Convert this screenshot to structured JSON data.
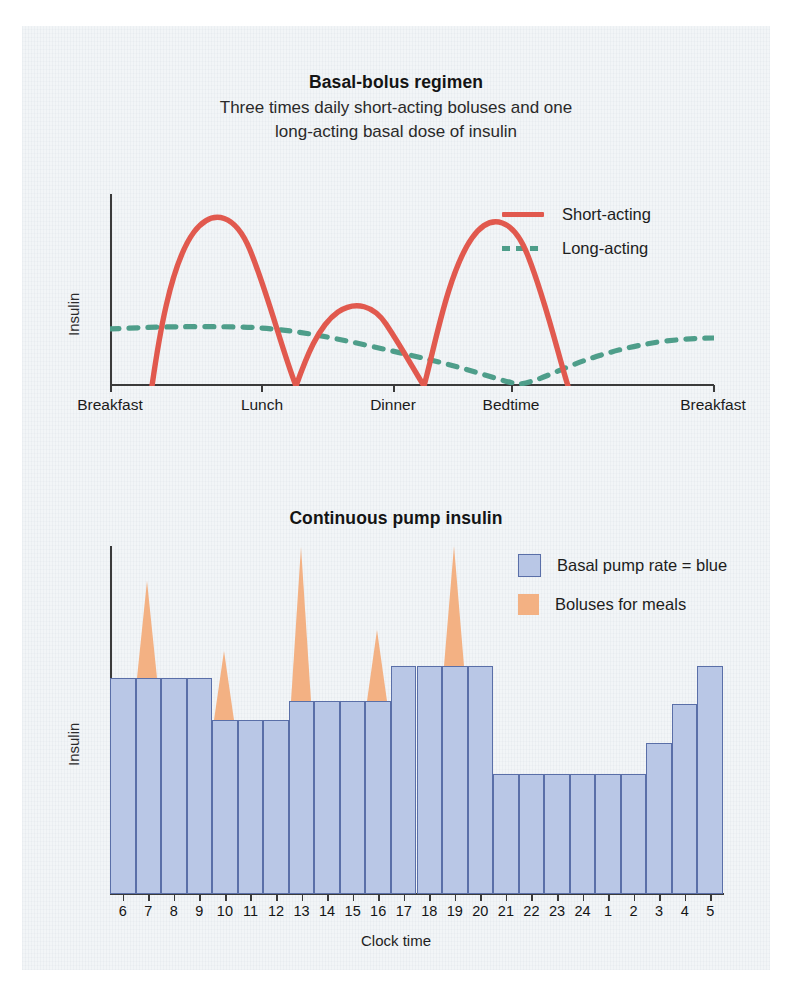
{
  "page": {
    "background": "#f2f5f7"
  },
  "colors": {
    "short_acting": "#e1594e",
    "long_acting": "#4e9e8a",
    "basal_fill": "#b9c7e6",
    "basal_stroke": "#5a6fa8",
    "bolus_fill": "#f3b183",
    "axis": "#3a3a3a",
    "text": "#1a1a1a"
  },
  "chart1": {
    "title": "Basal-bolus regimen",
    "subtitle_line1": "Three times daily short-acting boluses and one",
    "subtitle_line2": "long-acting basal dose of insulin",
    "ylabel": "Insulin",
    "legend": [
      {
        "label": "Short-acting",
        "style": "solid",
        "color": "#e1594e"
      },
      {
        "label": "Long-acting",
        "style": "dashed",
        "color": "#4e9e8a"
      }
    ],
    "xticks": [
      "Breakfast",
      "Lunch",
      "Dinner",
      "Bedtime",
      "Breakfast"
    ]
  },
  "chart2": {
    "title": "Continuous pump insulin",
    "ylabel": "Insulin",
    "xlabel": "Clock time",
    "legend": [
      {
        "label": "Basal pump rate = blue",
        "color": "#b9c7e6"
      },
      {
        "label": "Boluses for meals",
        "color": "#f3b183"
      }
    ]
  },
  "chart_data": [
    {
      "type": "line",
      "title": "Basal-bolus regimen",
      "subtitle": "Three times daily short-acting boluses and one long-acting basal dose of insulin",
      "xlabel": "",
      "ylabel": "Insulin",
      "grid": false,
      "legend_position": "top-right",
      "x_categories": [
        "Breakfast",
        "Lunch",
        "Dinner",
        "Bedtime",
        "Breakfast"
      ],
      "x_category_positions": [
        0.0,
        0.25,
        0.47,
        0.67,
        1.0
      ],
      "ylim": [
        0,
        1
      ],
      "series": [
        {
          "name": "Short-acting",
          "style": "solid",
          "color": "#e1594e",
          "description": "Three bolus peaks: tall at breakfast, shorter at lunch, tall at dinner",
          "peaks": [
            {
              "meal": "Breakfast",
              "x": 0.17,
              "height": 0.93
            },
            {
              "meal": "Lunch",
              "x": 0.43,
              "height": 0.52
            },
            {
              "meal": "Dinner",
              "x": 0.7,
              "height": 0.93
            }
          ],
          "points": [
            [
              0.07,
              0.0
            ],
            [
              0.1,
              0.3
            ],
            [
              0.13,
              0.68
            ],
            [
              0.17,
              0.93
            ],
            [
              0.21,
              0.82
            ],
            [
              0.26,
              0.45
            ],
            [
              0.3,
              0.05
            ],
            [
              0.315,
              0.0
            ],
            [
              0.315,
              0.0
            ],
            [
              0.34,
              0.2
            ],
            [
              0.38,
              0.44
            ],
            [
              0.43,
              0.52
            ],
            [
              0.48,
              0.45
            ],
            [
              0.53,
              0.25
            ],
            [
              0.565,
              0.0
            ],
            [
              0.565,
              0.0
            ],
            [
              0.6,
              0.38
            ],
            [
              0.65,
              0.8
            ],
            [
              0.7,
              0.93
            ],
            [
              0.74,
              0.82
            ],
            [
              0.79,
              0.45
            ],
            [
              0.835,
              0.0
            ]
          ]
        },
        {
          "name": "Long-acting",
          "style": "dashed",
          "color": "#4e9e8a",
          "description": "Flat-topped basal curve that slowly declines through the day, troughs near zero at bedtime, then rises overnight",
          "points": [
            [
              0.0,
              0.3
            ],
            [
              0.12,
              0.305
            ],
            [
              0.22,
              0.295
            ],
            [
              0.31,
              0.265
            ],
            [
              0.42,
              0.225
            ],
            [
              0.52,
              0.185
            ],
            [
              0.6,
              0.145
            ],
            [
              0.66,
              0.075
            ],
            [
              0.695,
              0.02
            ],
            [
              0.73,
              0.075
            ],
            [
              0.79,
              0.14
            ],
            [
              0.86,
              0.2
            ],
            [
              0.93,
              0.245
            ],
            [
              1.0,
              0.255
            ]
          ]
        }
      ]
    },
    {
      "type": "bar",
      "title": "Continuous pump insulin",
      "xlabel": "Clock time",
      "ylabel": "Insulin",
      "grid": false,
      "legend_position": "top-right",
      "ylim": [
        0,
        1
      ],
      "categories": [
        "6",
        "7",
        "8",
        "9",
        "10",
        "11",
        "12",
        "13",
        "14",
        "15",
        "16",
        "17",
        "18",
        "19",
        "20",
        "21",
        "22",
        "23",
        "24",
        "1",
        "2",
        "3",
        "4",
        "5"
      ],
      "series": [
        {
          "name": "Basal pump rate",
          "color": "#b9c7e6",
          "values": [
            0.62,
            0.62,
            0.62,
            0.62,
            0.5,
            0.5,
            0.5,
            0.555,
            0.555,
            0.555,
            0.555,
            0.655,
            0.655,
            0.655,
            0.655,
            0.345,
            0.345,
            0.345,
            0.345,
            0.345,
            0.345,
            0.435,
            0.545,
            0.655
          ]
        },
        {
          "name": "Boluses for meals",
          "color": "#f3b183",
          "description": "Triangular bolus spikes drawn on top of the basal bars",
          "bolus_hours": [
            "7",
            "10",
            "13",
            "16",
            "19"
          ],
          "bolus_peak_values": [
            0.9,
            0.7,
            1.0,
            0.76,
            1.0
          ]
        }
      ]
    }
  ]
}
